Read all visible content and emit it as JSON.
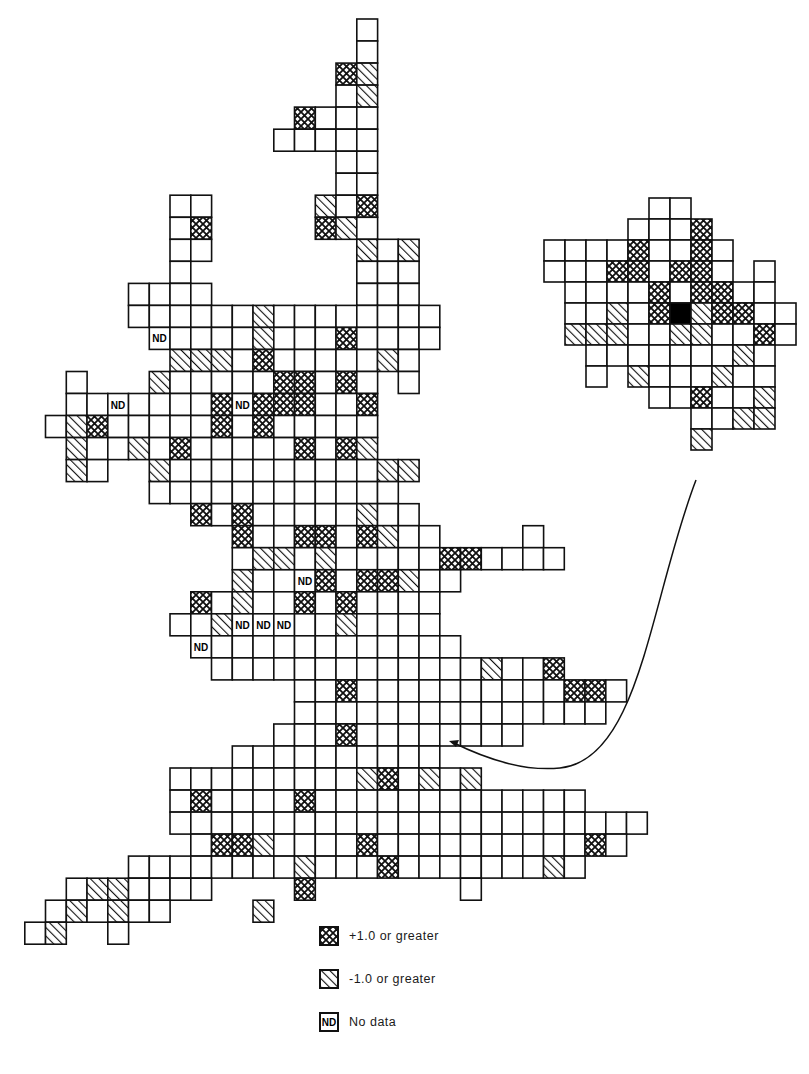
{
  "figure": {
    "cell_codes": {
      "e": "empty",
      "x": "+1.0 or greater (cross-hatched)",
      "d": "-1.0 or greater (diagonal hatched)",
      "n": "No data (ND)",
      "b": "solid black"
    },
    "colors": {
      "line": "#111111",
      "background": "#ffffff",
      "solid": "#000000"
    }
  },
  "legend": {
    "items": [
      {
        "pattern": "cross",
        "label": "+1.0 or greater"
      },
      {
        "pattern": "diag",
        "label": "-1.0 or greater"
      },
      {
        "pattern": "nd",
        "swatch_text": "ND",
        "label": "No data"
      }
    ]
  },
  "main_map": {
    "origin_x": 4,
    "origin_y": 19,
    "cell_w": 20.75,
    "cell_h": 22.03,
    "nd_label": "ND",
    "rows": [
      {
        "r": 0,
        "c": 17,
        "cells": "e"
      },
      {
        "r": 1,
        "c": 17,
        "cells": "e"
      },
      {
        "r": 2,
        "c": 16,
        "cells": "xd"
      },
      {
        "r": 3,
        "c": 16,
        "cells": "ed"
      },
      {
        "r": 4,
        "c": 14,
        "cells": "xeee"
      },
      {
        "r": 5,
        "c": 13,
        "cells": "eeeee"
      },
      {
        "r": 6,
        "c": 16,
        "cells": "ee"
      },
      {
        "r": 7,
        "c": 16,
        "cells": "ee"
      },
      {
        "r": 8,
        "c": 8,
        "cells": "ee"
      },
      {
        "r": 8,
        "c": 15,
        "cells": "dex"
      },
      {
        "r": 9,
        "c": 8,
        "cells": "ex"
      },
      {
        "r": 9,
        "c": 15,
        "cells": "xde"
      },
      {
        "r": 10,
        "c": 8,
        "cells": "ee"
      },
      {
        "r": 10,
        "c": 16,
        "cells": "_ded"
      },
      {
        "r": 11,
        "c": 8,
        "cells": "e"
      },
      {
        "r": 11,
        "c": 17,
        "cells": "eee"
      },
      {
        "r": 12,
        "c": 6,
        "cells": "eeee"
      },
      {
        "r": 12,
        "c": 17,
        "cells": "eee"
      },
      {
        "r": 13,
        "c": 6,
        "cells": "eeeeeedeeeeeeee"
      },
      {
        "r": 14,
        "c": 7,
        "cells": "neeeedeeexeeee"
      },
      {
        "r": 15,
        "c": 8,
        "cells": "dddexeeeeede"
      },
      {
        "r": 16,
        "c": 3,
        "cells": "e"
      },
      {
        "r": 16,
        "c": 7,
        "cells": "deeeeexxexe"
      },
      {
        "r": 16,
        "c": 19,
        "cells": "e"
      },
      {
        "r": 17,
        "c": 3,
        "cells": "eeneeeexnxxxeex"
      },
      {
        "r": 18,
        "c": 2,
        "cells": "edxeeeeexexeeeee"
      },
      {
        "r": 19,
        "c": 3,
        "cells": "deedexeeeeexexd"
      },
      {
        "r": 20,
        "c": 3,
        "cells": "de"
      },
      {
        "r": 20,
        "c": 7,
        "cells": "deeeeeeeeeedd"
      },
      {
        "r": 21,
        "c": 7,
        "cells": "eeeeeeeeeeee"
      },
      {
        "r": 22,
        "c": 9,
        "cells": "xexeeeeedee"
      },
      {
        "r": 23,
        "c": 11,
        "cells": "xeexxexdee"
      },
      {
        "r": 23,
        "c": 25,
        "cells": "e"
      },
      {
        "r": 24,
        "c": 11,
        "cells": "eddedeeeeexxeeee"
      },
      {
        "r": 25,
        "c": 11,
        "cells": "deenxexxdee"
      },
      {
        "r": 26,
        "c": 9,
        "cells": "xedeexexeeee"
      },
      {
        "r": 27,
        "c": 8,
        "cells": "eednnneedeeee"
      },
      {
        "r": 28,
        "c": 9,
        "cells": "neeeeeeeeeeee"
      },
      {
        "r": 29,
        "c": 10,
        "cells": "eeeeeeeeeeeeedeex"
      },
      {
        "r": 30,
        "c": 14,
        "cells": "eexeeeeeeeeeexxe"
      },
      {
        "r": 31,
        "c": 14,
        "cells": "eeeeeeeeeeeeeee"
      },
      {
        "r": 32,
        "c": 13,
        "cells": "eeexeeeeeeee"
      },
      {
        "r": 33,
        "c": 11,
        "cells": "eeeeeeeeee"
      },
      {
        "r": 34,
        "c": 8,
        "cells": "eeeeeeeeedxeded"
      },
      {
        "r": 35,
        "c": 8,
        "cells": "exeeeexeeeeeeeeeeeee"
      },
      {
        "r": 36,
        "c": 8,
        "cells": "eeeeeeeeeeeeeeeeeeeeeee"
      },
      {
        "r": 37,
        "c": 9,
        "cells": "exxdeeeexeeeeeeeeeexe"
      },
      {
        "r": 38,
        "c": 6,
        "cells": "eeeeeeeedeeexeeeeeeede"
      },
      {
        "r": 39,
        "c": 3,
        "cells": "eddeeee"
      },
      {
        "r": 39,
        "c": 14,
        "cells": "x"
      },
      {
        "r": 39,
        "c": 22,
        "cells": "e"
      },
      {
        "r": 40,
        "c": 2,
        "cells": "ededee"
      },
      {
        "r": 40,
        "c": 12,
        "cells": "d"
      },
      {
        "r": 41,
        "c": 1,
        "cells": "ed__e"
      }
    ]
  },
  "inset_map": {
    "origin_x": 544,
    "origin_y": 198,
    "cell_w": 21,
    "cell_h": 21,
    "rows": [
      {
        "r": 0,
        "c": 5,
        "cells": "ee"
      },
      {
        "r": 1,
        "c": 4,
        "cells": "eeex"
      },
      {
        "r": 2,
        "c": 0,
        "cells": "eeeexeexe"
      },
      {
        "r": 3,
        "c": 0,
        "cells": "eeexxexxe"
      },
      {
        "r": 3,
        "c": 10,
        "cells": "e"
      },
      {
        "r": 4,
        "c": 1,
        "cells": "eeeexexxee"
      },
      {
        "r": 5,
        "c": 1,
        "cells": "eedexbdxxee"
      },
      {
        "r": 6,
        "c": 1,
        "cells": "dddeeddeexe"
      },
      {
        "r": 7,
        "c": 2,
        "cells": "eeeeeeede"
      },
      {
        "r": 8,
        "c": 2,
        "cells": "e_deeedee"
      },
      {
        "r": 9,
        "c": 5,
        "cells": "eexeed"
      },
      {
        "r": 10,
        "c": 7,
        "cells": "eedd"
      },
      {
        "r": 11,
        "c": 7,
        "cells": "d"
      }
    ]
  },
  "arrow": {
    "path": "M 696 480 C 650 600, 640 760, 560 768 C 520 772, 480 756, 452 742",
    "head_x": 449,
    "head_y": 741
  }
}
